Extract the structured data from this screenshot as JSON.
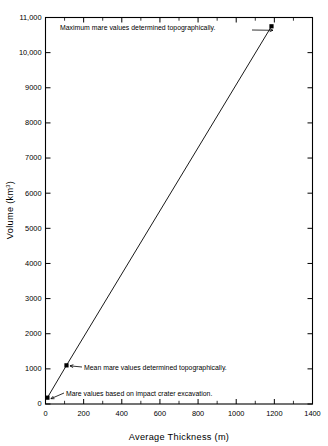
{
  "chart_data": {
    "type": "line",
    "title": "",
    "xlabel": "Average Thickness (m)",
    "ylabel": "Volume (km",
    "ylabel_sup": "3",
    "ylabel_suffix": ")",
    "ylabel_full": "Volume (km3)",
    "xlim": [
      0,
      1400
    ],
    "ylim": [
      0,
      11000
    ],
    "grid": false,
    "legend": "none",
    "x_major_step": 200,
    "x_minor_step": 100,
    "y_major_step": 1000,
    "x_ticklabels": [
      "0",
      "200",
      "400",
      "600",
      "800",
      "1000",
      "1200",
      "1400"
    ],
    "x_tickvalues": [
      0,
      200,
      400,
      600,
      800,
      1000,
      1200,
      1400
    ],
    "y_ticklabels": [
      "0",
      "1000",
      "2000",
      "3000",
      "4000",
      "5000",
      "6000",
      "7000",
      "8000",
      "9000",
      "10,000",
      "11,000"
    ],
    "y_tickvalues": [
      0,
      1000,
      2000,
      3000,
      4000,
      5000,
      6000,
      7000,
      8000,
      9000,
      10000,
      11000
    ],
    "series": [
      {
        "name": "Mare volume vs average thickness",
        "x": [
          10,
          110,
          1185
        ],
        "y": [
          180,
          1100,
          10750
        ],
        "marker": "filled-square"
      }
    ],
    "annotations": [
      {
        "text": "Maximum mare values determined topographically.",
        "points_to_x": 1185,
        "points_to_y": 10750
      },
      {
        "text": "Mean mare values determined topographically.",
        "points_to_x": 110,
        "points_to_y": 1100
      },
      {
        "text": "Mare values based on impact crater excavation.",
        "points_to_x": 10,
        "points_to_y": 180
      }
    ]
  }
}
